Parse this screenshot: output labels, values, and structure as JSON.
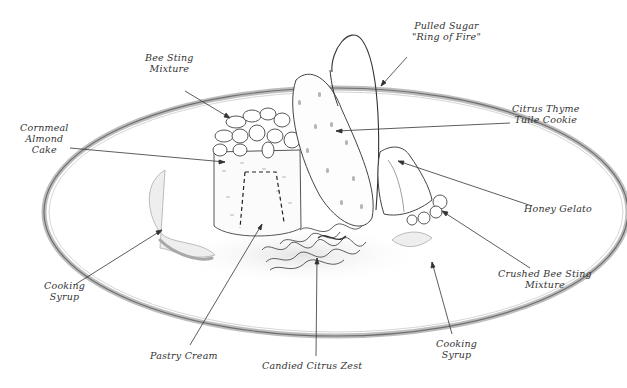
{
  "diagram": {
    "colors": {
      "ink": "#2a2a2a",
      "shade": "#c8c8c8",
      "plate_rim": "#9a9a9a",
      "background": "#ffffff"
    },
    "labels": [
      {
        "id": "pulled-sugar",
        "lines": [
          "Pulled Sugar",
          "\"Ring of Fire\""
        ],
        "x": 420,
        "y": 26
      },
      {
        "id": "bee-sting-mixture",
        "lines": [
          "Bee Sting",
          "Mixture"
        ],
        "x": 152,
        "y": 55
      },
      {
        "id": "cornmeal-almond-cake",
        "lines": [
          "Cornmeal",
          "Almond",
          "Cake"
        ],
        "x": 28,
        "y": 124
      },
      {
        "id": "citrus-thyme-tuile",
        "lines": [
          "Citrus Thyme",
          "Tuile Cookie"
        ],
        "x": 512,
        "y": 108
      },
      {
        "id": "honey-gelato",
        "lines": [
          "Honey Gelato"
        ],
        "x": 524,
        "y": 204
      },
      {
        "id": "crushed-bee-sting",
        "lines": [
          "Crushed Bee Sting",
          "Mixture"
        ],
        "x": 500,
        "y": 269
      },
      {
        "id": "cooking-syrup-left",
        "lines": [
          "Cooking",
          "Syrup"
        ],
        "x": 46,
        "y": 281
      },
      {
        "id": "pastry-cream",
        "lines": [
          "Pastry Cream"
        ],
        "x": 152,
        "y": 350
      },
      {
        "id": "candied-citrus-zest",
        "lines": [
          "Candied Citrus Zest"
        ],
        "x": 262,
        "y": 360
      },
      {
        "id": "cooking-syrup-right",
        "lines": [
          "Cooking",
          "Syrup"
        ],
        "x": 438,
        "y": 340
      }
    ]
  }
}
